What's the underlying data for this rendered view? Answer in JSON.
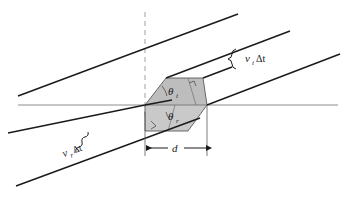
{
  "figure": {
    "type": "optics-refraction-diagram",
    "background_color": "#ffffff",
    "line_color": "#1a1a1a",
    "interface_color": "#8c8c8c",
    "normal_color": "#a0a0a0",
    "shade_fill": "#bdbdbd",
    "shade_fill_light": "#cfcfcf",
    "shade_stroke": "#555555"
  },
  "labels": {
    "angle_incident": {
      "symbol": "θ",
      "subscript": "i",
      "name": "angle-of-incidence"
    },
    "angle_refracted": {
      "symbol": "θ",
      "subscript": "r",
      "name": "angle-of-refraction"
    },
    "distance_incident": {
      "symbol": "v",
      "subscript": "i",
      "suffix": "Δt",
      "name": "incident-wave-travel-distance"
    },
    "distance_refracted": {
      "symbol": "v",
      "subscript": "r",
      "suffix": "Δt",
      "name": "refracted-wave-travel-distance"
    },
    "baseline": {
      "symbol": "d",
      "name": "interface-segment-length"
    }
  },
  "geometry": {
    "interface_line": {
      "x1": 18,
      "y1": 105,
      "x2": 338,
      "y2": 105
    },
    "normal_line": {
      "x1": 145,
      "y1": 12,
      "x2": 145,
      "y2": 116
    },
    "intersection_point": {
      "x": 145,
      "y": 105
    },
    "right_point": {
      "x": 207,
      "y": 105
    },
    "incident_slope": -0.36,
    "refracted_slope": -0.62,
    "dimension_line_y": 148,
    "dimension_x1": 145,
    "dimension_x2": 207
  }
}
